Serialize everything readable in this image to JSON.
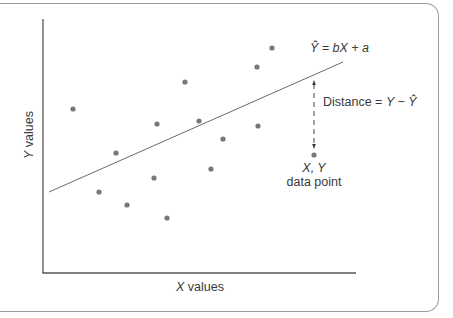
{
  "chart_data": {
    "type": "scatter",
    "title": "",
    "xlabel": "X values",
    "ylabel": "Y values",
    "grid": false,
    "legend": null,
    "axis_ticks": "none",
    "points_pixel": [
      [
        73,
        109
      ],
      [
        99,
        192
      ],
      [
        116,
        153
      ],
      [
        127,
        205
      ],
      [
        154,
        178
      ],
      [
        157,
        124
      ],
      [
        167,
        218
      ],
      [
        185,
        82
      ],
      [
        199,
        121
      ],
      [
        211,
        169
      ],
      [
        223,
        139
      ],
      [
        257,
        67
      ],
      [
        258,
        126
      ],
      [
        272,
        48
      ],
      [
        314,
        155
      ]
    ],
    "points_normalized": [
      {
        "x": 0.1,
        "y": 0.65
      },
      {
        "x": 0.18,
        "y": 0.32
      },
      {
        "x": 0.24,
        "y": 0.47
      },
      {
        "x": 0.27,
        "y": 0.27
      },
      {
        "x": 0.36,
        "y": 0.37
      },
      {
        "x": 0.37,
        "y": 0.59
      },
      {
        "x": 0.4,
        "y": 0.22
      },
      {
        "x": 0.46,
        "y": 0.75
      },
      {
        "x": 0.5,
        "y": 0.6
      },
      {
        "x": 0.54,
        "y": 0.41
      },
      {
        "x": 0.58,
        "y": 0.53
      },
      {
        "x": 0.69,
        "y": 0.81
      },
      {
        "x": 0.69,
        "y": 0.58
      },
      {
        "x": 0.74,
        "y": 0.88
      },
      {
        "x": 0.87,
        "y": 0.47
      }
    ],
    "regression_line": {
      "label": "Ŷ = bX + a",
      "start_pixel": [
        49,
        192
      ],
      "end_pixel": [
        343,
        62
      ],
      "start_normalized": {
        "x": 0.02,
        "y": 0.32
      },
      "end_normalized": {
        "x": 0.96,
        "y": 0.83
      }
    },
    "annotations": [
      {
        "text": "Ŷ = bX + a",
        "target": "regression line"
      },
      {
        "text": "Distance = Y − Ŷ",
        "type": "dashed double-arrow",
        "from_pixel": [
          314,
          80
        ],
        "to_pixel": [
          314,
          149
        ]
      },
      {
        "text": "X, Y data point",
        "target_pixel": [
          314,
          155
        ]
      }
    ]
  },
  "labels": {
    "x_axis": "X values",
    "y_axis": "Y values",
    "equation": "Ŷ = bX + a",
    "distance": "Distance = Y − Ŷ",
    "point_line1": "X, Y",
    "point_line2": "data point"
  },
  "colors": {
    "axis": "#555555",
    "line": "#6a6a6a",
    "points": "#787878",
    "frame": "#9a9a9a"
  }
}
